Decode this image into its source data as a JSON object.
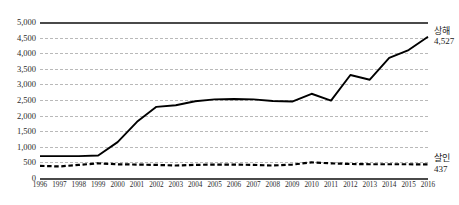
{
  "chart_data": {
    "type": "line",
    "title": "",
    "xlabel": "",
    "ylabel": "",
    "ylim": [
      0,
      5000
    ],
    "ytick_step": 500,
    "yticks": [
      "0",
      "500",
      "1,000",
      "1,500",
      "2,000",
      "2,500",
      "3,000",
      "3,500",
      "4,000",
      "4,500",
      "5,000"
    ],
    "grid": true,
    "legend_position": "right-end-labels",
    "categories": [
      "1996",
      "1997",
      "1998",
      "1999",
      "2000",
      "2001",
      "2002",
      "2003",
      "2004",
      "2005",
      "2006",
      "2007",
      "2008",
      "2009",
      "2010",
      "2011",
      "2012",
      "2013",
      "2014",
      "2015",
      "2016"
    ],
    "series": [
      {
        "name": "상해",
        "style": "solid",
        "color": "#000000",
        "end_label": "상해",
        "end_value": "4,527",
        "values": [
          700,
          700,
          700,
          720,
          1150,
          1800,
          2280,
          2330,
          2460,
          2520,
          2530,
          2520,
          2470,
          2450,
          2700,
          2480,
          3300,
          3150,
          3850,
          4100,
          4527
        ]
      },
      {
        "name": "살인",
        "style": "dashed",
        "color": "#000000",
        "end_label": "살인",
        "end_value": "437",
        "values": [
          390,
          370,
          420,
          470,
          440,
          430,
          420,
          400,
          420,
          430,
          430,
          420,
          400,
          430,
          500,
          470,
          450,
          440,
          440,
          440,
          437
        ]
      }
    ]
  },
  "axes": {
    "y_min_label": "0",
    "y_max_label": "5,000"
  }
}
